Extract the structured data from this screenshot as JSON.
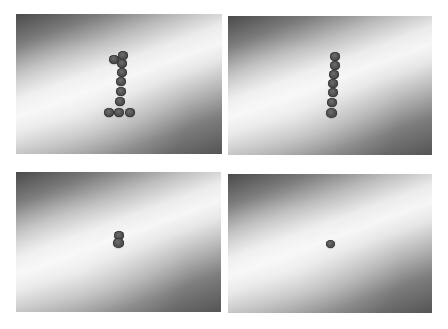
{
  "figure": {
    "layout": "2x2 grid of photographs",
    "background_color": "#ffffff",
    "surface_shading": {
      "dark_color": "#4a4a4a",
      "light_color": "#f6f6f6",
      "coin_color": "#525252"
    },
    "panels": [
      {
        "id": "top-left",
        "description": "Coins arranged in the shape of the digit 1",
        "coin_count": 10,
        "rect": {
          "x": 16,
          "y": 14,
          "w": 206,
          "h": 140
        },
        "coins": [
          {
            "x": 114,
            "y": 59,
            "r": 5
          },
          {
            "x": 123,
            "y": 55,
            "r": 5
          },
          {
            "x": 122,
            "y": 63,
            "r": 5
          },
          {
            "x": 122,
            "y": 72,
            "r": 5
          },
          {
            "x": 121,
            "y": 81,
            "r": 5
          },
          {
            "x": 121,
            "y": 91,
            "r": 5
          },
          {
            "x": 120,
            "y": 101,
            "r": 5
          },
          {
            "x": 109,
            "y": 112,
            "r": 5
          },
          {
            "x": 119,
            "y": 112,
            "r": 5
          },
          {
            "x": 130,
            "y": 112,
            "r": 5
          }
        ]
      },
      {
        "id": "top-right",
        "description": "Coins arranged in a single vertical column",
        "coin_count": 7,
        "rect": {
          "x": 228,
          "y": 16,
          "w": 204,
          "h": 139
        },
        "coins": [
          {
            "x": 335,
            "y": 56,
            "r": 5
          },
          {
            "x": 335,
            "y": 65,
            "r": 5
          },
          {
            "x": 334,
            "y": 74,
            "r": 5
          },
          {
            "x": 333,
            "y": 83,
            "r": 5
          },
          {
            "x": 333,
            "y": 92,
            "r": 5
          },
          {
            "x": 332,
            "y": 102,
            "r": 5
          },
          {
            "x": 331,
            "y": 113,
            "r": 5.5
          }
        ]
      },
      {
        "id": "bottom-left",
        "description": "Two coins stacked vertically",
        "coin_count": 2,
        "rect": {
          "x": 16,
          "y": 172,
          "w": 205,
          "h": 140
        },
        "coins": [
          {
            "x": 119,
            "y": 235,
            "r": 5
          },
          {
            "x": 118,
            "y": 243,
            "r": 5.5
          }
        ]
      },
      {
        "id": "bottom-right",
        "description": "A single coin",
        "coin_count": 1,
        "rect": {
          "x": 228,
          "y": 174,
          "w": 204,
          "h": 139
        },
        "coins": [
          {
            "x": 330,
            "y": 244,
            "r": 4.5
          }
        ]
      }
    ]
  }
}
